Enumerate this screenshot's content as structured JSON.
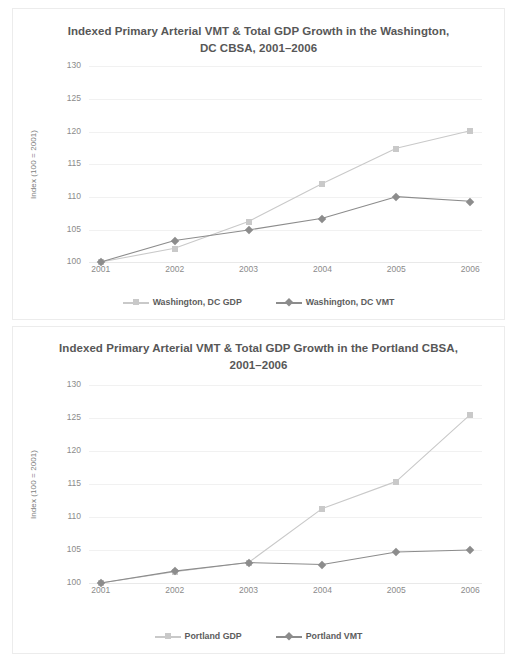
{
  "colors": {
    "gdp": "#c9c9c9",
    "vmt": "#8c8c8c",
    "grid": "#f1f1f1",
    "title_text": "#575757",
    "tick_text": "#8b8b8b",
    "card_border": "#ececec",
    "background": "#ffffff"
  },
  "panels": [
    {
      "id": "washington",
      "title": "Indexed Primary Arterial VMT & Total GDP Growth in the Washington, DC CBSA, 2001–2006",
      "ylabel": "Index (100 = 2001)",
      "yticks": [
        "100",
        "105",
        "110",
        "115",
        "120",
        "125",
        "130"
      ],
      "xticks": [
        "2001",
        "2002",
        "2003",
        "2004",
        "2005",
        "2006"
      ],
      "legend": [
        {
          "label": "Washington, DC GDP",
          "marker": "square",
          "color": "#c9c9c9"
        },
        {
          "label": "Washington, DC VMT",
          "marker": "diamond",
          "color": "#8c8c8c"
        }
      ]
    },
    {
      "id": "portland",
      "title": "Indexed Primary Arterial VMT & Total GDP Growth in the Portland CBSA, 2001–2006",
      "ylabel": "Index (100 = 2001)",
      "yticks": [
        "100",
        "105",
        "110",
        "115",
        "120",
        "125",
        "130"
      ],
      "xticks": [
        "2001",
        "2002",
        "2003",
        "2004",
        "2005",
        "2006"
      ],
      "legend": [
        {
          "label": "Portland GDP",
          "marker": "square",
          "color": "#c9c9c9"
        },
        {
          "label": "Portland VMT",
          "marker": "diamond",
          "color": "#8c8c8c"
        }
      ]
    }
  ],
  "chart_data": [
    {
      "type": "line",
      "title": "Indexed Primary Arterial VMT & Total GDP Growth in the Washington, DC CBSA, 2001–2006",
      "xlabel": "",
      "ylabel": "Index (100 = 2001)",
      "categories": [
        "2001",
        "2002",
        "2003",
        "2004",
        "2005",
        "2006"
      ],
      "ylim": [
        100,
        130
      ],
      "ytick_step": 5,
      "grid": true,
      "legend_position": "bottom",
      "series": [
        {
          "name": "Washington, DC GDP",
          "marker": "square",
          "color": "#c9c9c9",
          "values": [
            100,
            102.1,
            106.2,
            112.0,
            117.4,
            120.1
          ]
        },
        {
          "name": "Washington, DC VMT",
          "marker": "diamond",
          "color": "#8c8c8c",
          "values": [
            100,
            103.3,
            104.9,
            106.7,
            110.0,
            109.3
          ]
        }
      ]
    },
    {
      "type": "line",
      "title": "Indexed Primary Arterial VMT & Total GDP Growth in the Portland CBSA, 2001–2006",
      "xlabel": "",
      "ylabel": "Index (100 = 2001)",
      "categories": [
        "2001",
        "2002",
        "2003",
        "2004",
        "2005",
        "2006"
      ],
      "ylim": [
        100,
        130
      ],
      "ytick_step": 5,
      "grid": true,
      "legend_position": "bottom",
      "series": [
        {
          "name": "Portland GDP",
          "marker": "square",
          "color": "#c9c9c9",
          "values": [
            100,
            101.7,
            103.1,
            111.3,
            115.4,
            125.5
          ]
        },
        {
          "name": "Portland VMT",
          "marker": "diamond",
          "color": "#8c8c8c",
          "values": [
            100,
            101.8,
            103.1,
            102.8,
            104.7,
            105.0
          ]
        }
      ]
    }
  ]
}
